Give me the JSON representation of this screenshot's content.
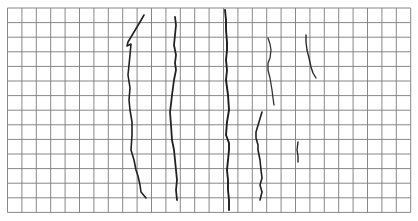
{
  "image": {
    "description": "Photograph of dark root-like strands laid on white grid paper",
    "background": "#ffffff",
    "grid": {
      "origin_x": 7.5,
      "origin_y": 8,
      "columns": 28,
      "rows": 14,
      "cell_w": 14.4,
      "cell_h": 14.6,
      "line_color": "#7a7a7a"
    },
    "strands": [
      {
        "name": "strand-1",
        "color": "#222222",
        "width": 1.6,
        "points": [
          [
            144,
            15
          ],
          [
            140,
            22
          ],
          [
            134,
            32
          ],
          [
            128,
            42
          ],
          [
            127,
            46
          ],
          [
            131,
            44
          ],
          [
            130,
            55
          ],
          [
            129,
            65
          ],
          [
            128,
            75
          ],
          [
            130,
            88
          ],
          [
            129,
            100
          ],
          [
            130,
            110
          ],
          [
            132,
            122
          ],
          [
            132,
            135
          ],
          [
            131,
            150
          ],
          [
            134,
            160
          ],
          [
            136,
            170
          ],
          [
            138,
            176
          ],
          [
            140,
            185
          ],
          [
            141,
            192
          ],
          [
            146,
            198
          ]
        ]
      },
      {
        "name": "strand-2",
        "color": "#222222",
        "width": 1.8,
        "points": [
          [
            175,
            17
          ],
          [
            176,
            25
          ],
          [
            175,
            35
          ],
          [
            174,
            45
          ],
          [
            176,
            55
          ],
          [
            175,
            63
          ],
          [
            176,
            70
          ],
          [
            174,
            80
          ],
          [
            172,
            95
          ],
          [
            171,
            104
          ],
          [
            170,
            112
          ],
          [
            171,
            125
          ],
          [
            172,
            140
          ],
          [
            174,
            150
          ],
          [
            175,
            160
          ],
          [
            176,
            170
          ],
          [
            177,
            180
          ],
          [
            176,
            190
          ],
          [
            177,
            200
          ]
        ]
      },
      {
        "name": "strand-3",
        "color": "#1e1e1e",
        "width": 1.9,
        "points": [
          [
            225,
            10
          ],
          [
            226,
            20
          ],
          [
            226,
            30
          ],
          [
            227,
            42
          ],
          [
            227,
            50
          ],
          [
            226,
            60
          ],
          [
            227,
            70
          ],
          [
            226,
            80
          ],
          [
            228,
            95
          ],
          [
            229,
            110
          ],
          [
            227,
            122
          ],
          [
            226,
            135
          ],
          [
            229,
            143
          ],
          [
            229,
            150
          ],
          [
            228,
            160
          ],
          [
            227,
            170
          ],
          [
            228,
            180
          ],
          [
            228,
            190
          ],
          [
            229,
            200
          ],
          [
            229,
            210
          ]
        ]
      },
      {
        "name": "strand-4",
        "color": "#333333",
        "width": 1.3,
        "points": [
          [
            268,
            38
          ],
          [
            270,
            44
          ],
          [
            271,
            50
          ],
          [
            270,
            58
          ],
          [
            268,
            63
          ],
          [
            268,
            70
          ],
          [
            270,
            78
          ],
          [
            272,
            90
          ],
          [
            273,
            98
          ],
          [
            274,
            105
          ]
        ]
      },
      {
        "name": "strand-5",
        "color": "#222222",
        "width": 1.6,
        "points": [
          [
            262,
            112
          ],
          [
            259,
            122
          ],
          [
            256,
            132
          ],
          [
            256,
            138
          ],
          [
            258,
            145
          ],
          [
            258,
            150
          ],
          [
            260,
            160
          ],
          [
            261,
            170
          ],
          [
            262,
            178
          ],
          [
            260,
            185
          ],
          [
            262,
            192
          ],
          [
            260,
            200
          ]
        ]
      },
      {
        "name": "strand-6",
        "color": "#2a2a2a",
        "width": 1.4,
        "points": [
          [
            306,
            35
          ],
          [
            306,
            42
          ],
          [
            307,
            50
          ],
          [
            309,
            58
          ],
          [
            311,
            67
          ],
          [
            313,
            73
          ],
          [
            316,
            78
          ]
        ]
      },
      {
        "name": "strand-7",
        "color": "#2a2a2a",
        "width": 1.4,
        "points": [
          [
            298,
            142
          ],
          [
            297,
            150
          ],
          [
            298,
            156
          ],
          [
            298,
            162
          ]
        ]
      }
    ]
  }
}
